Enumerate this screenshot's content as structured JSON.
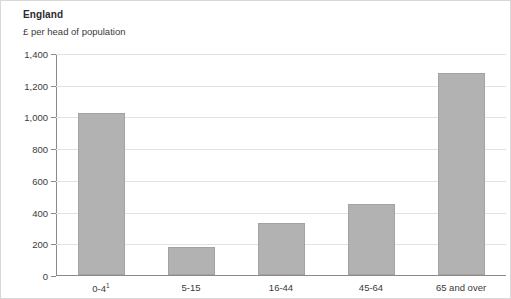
{
  "chart_data": {
    "type": "bar",
    "title": "England",
    "subtitle": "£ per head of population",
    "xlabel": "",
    "ylabel": "",
    "categories": [
      "0-4",
      "5-15",
      "16-44",
      "45-64",
      "65 and over"
    ],
    "category_footnotes": [
      "1",
      "",
      "",
      "",
      ""
    ],
    "values": [
      1020,
      175,
      325,
      450,
      1275
    ],
    "ylim": [
      0,
      1400
    ],
    "yticks": [
      0,
      200,
      400,
      600,
      800,
      1000,
      1200,
      1400
    ],
    "ytick_labels": [
      "0",
      "200",
      "400",
      "600",
      "800",
      "1,000",
      "1,200",
      "1,400"
    ],
    "grid": true,
    "legend": false,
    "bar_color": "#b2b2b2",
    "bar_border_color": "#a3a3a3",
    "gridline_color": "#e3e3e3",
    "axis_color": "#8a8a8a",
    "background": "#ffffff"
  }
}
